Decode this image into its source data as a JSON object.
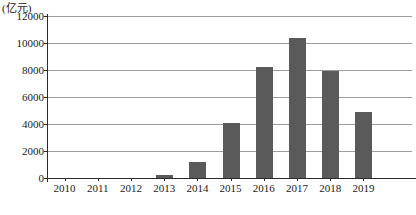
{
  "chart_data": {
    "type": "bar",
    "title": "",
    "subtitle": "",
    "xlabel": "",
    "ylabel": "(亿元)",
    "unit_caption": "(亿元)",
    "categories": [
      "2010",
      "2011",
      "2012",
      "2013",
      "2014",
      "2015",
      "2016",
      "2017",
      "2018",
      "2019"
    ],
    "values": [
      0,
      0,
      0,
      200,
      1200,
      4050,
      8200,
      10400,
      7900,
      4900
    ],
    "series": [
      {
        "name": "",
        "values": [
          0,
          0,
          0,
          200,
          1200,
          4050,
          8200,
          10400,
          7900,
          4900
        ]
      }
    ],
    "ylim": [
      0,
      12000
    ],
    "ytick_labels": [
      "0",
      "2000",
      "4000",
      "6000",
      "8000",
      "10000",
      "12000"
    ],
    "ytick_values": [
      0,
      2000,
      4000,
      6000,
      8000,
      10000,
      12000
    ],
    "grid": true,
    "legend": false,
    "legend_position": "none",
    "bar_color": "#5a5a5a",
    "gridline_color": "#9d9d9d",
    "axis_color": "#2b2b2b",
    "background_color": "#ffffff"
  }
}
